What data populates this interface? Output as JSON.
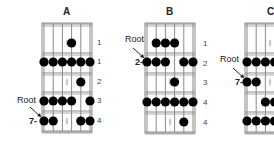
{
  "diagrams": [
    {
      "id": "A",
      "title": "A",
      "root_label": "Root",
      "start_fret": "7-",
      "finger_labels": [
        "1",
        "1",
        "2",
        "3",
        "4"
      ],
      "rows": [
        [
          4
        ],
        [
          1,
          2,
          3,
          4,
          5,
          6
        ],
        [
          5
        ],
        [
          1,
          2,
          3,
          4,
          6
        ],
        [
          1,
          2,
          5,
          6
        ]
      ],
      "root_position": {
        "row": 5,
        "string": 1
      }
    },
    {
      "id": "B",
      "title": "B",
      "root_label": "Root",
      "start_fret": "2-",
      "finger_labels": [
        "1",
        "2",
        "3",
        "4",
        "4"
      ],
      "rows": [
        [
          2,
          3,
          4
        ],
        [
          1,
          2,
          3,
          5,
          6
        ],
        [
          4
        ],
        [
          1,
          2,
          3,
          4,
          5,
          6
        ],
        [
          5
        ]
      ],
      "root_position": {
        "row": 2,
        "string": 1
      }
    },
    {
      "id": "C",
      "title": "C",
      "root_label": "Root",
      "start_fret": "7-",
      "finger_labels": [],
      "rows": [
        [],
        [
          1,
          2,
          3,
          4
        ],
        [
          1,
          2
        ],
        [
          3,
          4
        ],
        [
          1,
          2,
          3,
          4
        ]
      ],
      "root_position": {
        "row": 3,
        "string": 1
      }
    }
  ],
  "colors": {
    "dot": "#000000",
    "grid": "#8a8a8a",
    "marker": "#c8c8c8"
  }
}
